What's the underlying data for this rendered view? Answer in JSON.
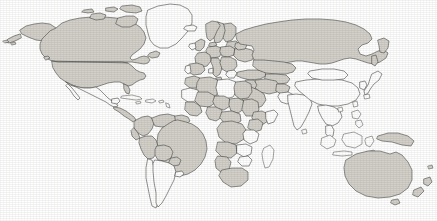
{
  "map": {
    "title": "World Map",
    "projection": "equirectangular",
    "background_color": "#ffffff",
    "land_fill_color": "#d2d0c9",
    "unfilled_color": "#ffffff",
    "border_color": "#4a4a48",
    "width": 437,
    "height": 221,
    "legend": {
      "visible": false,
      "filled_meaning": "highlighted country",
      "unfilled_meaning": "non-highlighted country"
    },
    "regions": [
      {
        "name": "north-america",
        "label": "North America",
        "countries": [
          {
            "name": "canada",
            "label": "Canada",
            "filled": true
          },
          {
            "name": "united-states",
            "label": "United States",
            "filled": true
          },
          {
            "name": "alaska",
            "label": "Alaska",
            "filled": true
          },
          {
            "name": "greenland",
            "label": "Greenland",
            "filled": false
          },
          {
            "name": "mexico",
            "label": "Mexico",
            "filled": false
          },
          {
            "name": "central-america",
            "label": "Central America",
            "filled": true
          },
          {
            "name": "cuba",
            "label": "Cuba",
            "filled": false
          },
          {
            "name": "hispaniola",
            "label": "Hispaniola",
            "filled": false
          }
        ]
      },
      {
        "name": "south-america",
        "label": "South America",
        "countries": [
          {
            "name": "colombia",
            "label": "Colombia",
            "filled": true
          },
          {
            "name": "venezuela",
            "label": "Venezuela",
            "filled": true
          },
          {
            "name": "guyanas",
            "label": "Guyanas",
            "filled": true
          },
          {
            "name": "brazil",
            "label": "Brazil",
            "filled": true
          },
          {
            "name": "peru",
            "label": "Peru",
            "filled": true
          },
          {
            "name": "bolivia",
            "label": "Bolivia",
            "filled": true
          },
          {
            "name": "paraguay",
            "label": "Paraguay",
            "filled": true
          },
          {
            "name": "chile",
            "label": "Chile",
            "filled": false
          },
          {
            "name": "argentina",
            "label": "Argentina",
            "filled": false
          },
          {
            "name": "uruguay",
            "label": "Uruguay",
            "filled": false
          },
          {
            "name": "ecuador",
            "label": "Ecuador",
            "filled": true
          }
        ]
      },
      {
        "name": "europe",
        "label": "Europe",
        "countries": [
          {
            "name": "iceland",
            "label": "Iceland",
            "filled": false
          },
          {
            "name": "united-kingdom",
            "label": "United Kingdom",
            "filled": true
          },
          {
            "name": "ireland",
            "label": "Ireland",
            "filled": false
          },
          {
            "name": "norway",
            "label": "Norway",
            "filled": true
          },
          {
            "name": "sweden",
            "label": "Sweden",
            "filled": true
          },
          {
            "name": "finland",
            "label": "Finland",
            "filled": true
          },
          {
            "name": "france",
            "label": "France",
            "filled": true
          },
          {
            "name": "spain",
            "label": "Spain",
            "filled": true
          },
          {
            "name": "portugal",
            "label": "Portugal",
            "filled": false
          },
          {
            "name": "germany",
            "label": "Germany",
            "filled": true
          },
          {
            "name": "poland",
            "label": "Poland",
            "filled": true
          },
          {
            "name": "italy",
            "label": "Italy",
            "filled": true
          },
          {
            "name": "balkans",
            "label": "Balkans",
            "filled": true
          },
          {
            "name": "ukraine",
            "label": "Ukraine",
            "filled": true
          },
          {
            "name": "belarus",
            "label": "Belarus",
            "filled": true
          },
          {
            "name": "baltics",
            "label": "Baltic States",
            "filled": true
          },
          {
            "name": "turkey",
            "label": "Turkey",
            "filled": true
          },
          {
            "name": "greece",
            "label": "Greece",
            "filled": false
          }
        ]
      },
      {
        "name": "asia",
        "label": "Asia",
        "countries": [
          {
            "name": "russia",
            "label": "Russia",
            "filled": true
          },
          {
            "name": "kazakhstan",
            "label": "Kazakhstan",
            "filled": true
          },
          {
            "name": "central-asia",
            "label": "Central Asia",
            "filled": true
          },
          {
            "name": "iran",
            "label": "Iran",
            "filled": true
          },
          {
            "name": "iraq",
            "label": "Iraq",
            "filled": true
          },
          {
            "name": "saudi-arabia",
            "label": "Saudi Arabia",
            "filled": true
          },
          {
            "name": "afghanistan",
            "label": "Afghanistan",
            "filled": true
          },
          {
            "name": "pakistan",
            "label": "Pakistan",
            "filled": false
          },
          {
            "name": "india",
            "label": "India",
            "filled": false
          },
          {
            "name": "china",
            "label": "China",
            "filled": false
          },
          {
            "name": "mongolia",
            "label": "Mongolia",
            "filled": false
          },
          {
            "name": "japan",
            "label": "Japan",
            "filled": false
          },
          {
            "name": "korea",
            "label": "Korea",
            "filled": false
          },
          {
            "name": "indochina",
            "label": "Indochina",
            "filled": false
          },
          {
            "name": "indonesia",
            "label": "Indonesia",
            "filled": false
          },
          {
            "name": "philippines",
            "label": "Philippines",
            "filled": false
          },
          {
            "name": "sri-lanka",
            "label": "Sri Lanka",
            "filled": false
          }
        ]
      },
      {
        "name": "africa",
        "label": "Africa",
        "countries": [
          {
            "name": "morocco",
            "label": "Morocco",
            "filled": true
          },
          {
            "name": "algeria",
            "label": "Algeria",
            "filled": true
          },
          {
            "name": "libya",
            "label": "Libya",
            "filled": false
          },
          {
            "name": "egypt",
            "label": "Egypt",
            "filled": true
          },
          {
            "name": "sudan",
            "label": "Sudan",
            "filled": true
          },
          {
            "name": "mali",
            "label": "Mali",
            "filled": true
          },
          {
            "name": "niger",
            "label": "Niger",
            "filled": true
          },
          {
            "name": "chad",
            "label": "Chad",
            "filled": true
          },
          {
            "name": "nigeria",
            "label": "Nigeria",
            "filled": true
          },
          {
            "name": "ethiopia",
            "label": "Ethiopia",
            "filled": true
          },
          {
            "name": "kenya",
            "label": "Kenya",
            "filled": true
          },
          {
            "name": "dr-congo",
            "label": "DR Congo",
            "filled": true
          },
          {
            "name": "angola",
            "label": "Angola",
            "filled": true
          },
          {
            "name": "tanzania",
            "label": "Tanzania",
            "filled": false
          },
          {
            "name": "zambia",
            "label": "Zambia",
            "filled": false
          },
          {
            "name": "zimbabwe",
            "label": "Zimbabwe",
            "filled": false
          },
          {
            "name": "south-africa",
            "label": "South Africa",
            "filled": true
          },
          {
            "name": "madagascar",
            "label": "Madagascar",
            "filled": false
          },
          {
            "name": "mauritania",
            "label": "Mauritania",
            "filled": false
          }
        ]
      },
      {
        "name": "oceania",
        "label": "Oceania",
        "countries": [
          {
            "name": "australia",
            "label": "Australia",
            "filled": true
          },
          {
            "name": "new-guinea",
            "label": "New Guinea",
            "filled": true
          },
          {
            "name": "new-zealand",
            "label": "New Zealand",
            "filled": true
          }
        ]
      }
    ]
  }
}
